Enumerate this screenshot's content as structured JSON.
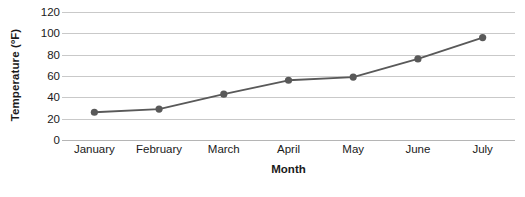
{
  "chart_data": {
    "type": "line",
    "title": "",
    "xlabel": "Month",
    "ylabel": "Temperature (ºF)",
    "categories": [
      "January",
      "February",
      "March",
      "April",
      "May",
      "June",
      "July"
    ],
    "values": [
      26,
      29,
      43,
      56,
      59,
      76,
      96
    ],
    "series": [
      {
        "name": "Temperature",
        "values": [
          26,
          29,
          43,
          56,
          59,
          76,
          96
        ]
      }
    ],
    "ylim": [
      0,
      120
    ],
    "yticks": [
      0,
      20,
      40,
      60,
      80,
      100,
      120
    ],
    "ytick_labels": [
      "0",
      "20",
      "40",
      "60",
      "80",
      "100",
      "120"
    ],
    "grid": true,
    "legend": false,
    "legend_position": "none",
    "marker": "circle",
    "colors": {
      "line": "#595959",
      "marker": "#595959",
      "gridline": "#c9c9c9",
      "baseline": "#b5b5b5",
      "text": "#1a1a1a",
      "background": "#ffffff"
    }
  }
}
